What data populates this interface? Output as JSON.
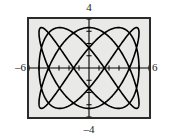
{
  "figure": {
    "name": "graphing-calculator-lissajous-plot",
    "background_color": "#ffffff",
    "screen_background_color": "#e9e9e7",
    "frame_color": "#2b2b2b",
    "curve_color": "#000000",
    "axis_color": "#000000"
  },
  "labels": {
    "y_max": "4",
    "y_min": "–4",
    "x_min": "–6",
    "x_max": "6"
  },
  "chart_data": {
    "type": "line",
    "title": "",
    "subtitle": "",
    "xlabel": "",
    "ylabel": "",
    "xlim": [
      -6,
      6
    ],
    "ylim": [
      -4,
      4
    ],
    "grid": false,
    "legend": false,
    "legend_position": "none",
    "axes": {
      "x_axis_visible": true,
      "y_axis_visible": true,
      "x_tick_labels": [
        "-6",
        "6"
      ],
      "y_tick_labels": [
        "4",
        "-4"
      ],
      "x_tick_spacing": 1,
      "y_tick_spacing": 1,
      "x_tick_count": 11,
      "y_tick_count": 7
    },
    "curve": {
      "name": "lissajous-curve",
      "description": "Parametric Lissajous figure",
      "parametric": true,
      "x_expression": "5*cos(3t)",
      "y_expression": "3.3*sin(5t)",
      "x_amplitude": 5,
      "y_amplitude": 3.3,
      "x_frequency": 3,
      "y_frequency": 5,
      "phase": 0,
      "t_min": 0,
      "t_max": 6.283185307,
      "samples": 1200,
      "line_width": 1.6,
      "color": "#000000"
    },
    "series": [
      {
        "name": "lissajous",
        "x_expression": "5*cos(3t)",
        "y_expression": "3.3*sin(5t)"
      }
    ]
  }
}
